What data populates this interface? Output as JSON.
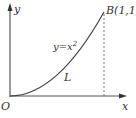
{
  "diagram": {
    "axes": {
      "x_label": "x",
      "y_label": "y",
      "origin_label": "O"
    },
    "curve": {
      "equation_prefix": "y=x",
      "equation_exponent": "2",
      "name": "L"
    },
    "point": {
      "label": "B(1,1)"
    },
    "colors": {
      "axis": "#555555",
      "curve": "#444444",
      "dashed": "#777777",
      "text": "#333333"
    }
  }
}
